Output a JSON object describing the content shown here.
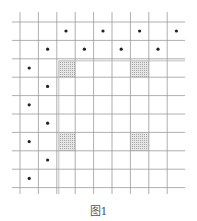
{
  "figure": {
    "caption": "图1",
    "grid": {
      "columns": 9,
      "rows": 9,
      "x_lines": [
        20,
        38.4,
        56.8,
        75.2,
        93.6,
        112,
        130.4,
        148.8,
        167.2
      ],
      "y_lines": [
        22,
        40.4,
        58.8,
        77.2,
        95.6,
        114,
        132.4,
        150.8,
        169.2,
        187.6
      ],
      "h_line_extent": [
        12,
        185
      ],
      "v_line_extent": [
        12,
        194
      ],
      "line_color": "#9a9a9a"
    },
    "inner_frame": {
      "x_line": 58.8,
      "y_line": 60.8,
      "color": "#b0b0b0"
    },
    "shaded_cells": [
      {
        "x": 58.8,
        "y": 60.8,
        "w": 16.4,
        "h": 16.4
      },
      {
        "x": 130.4,
        "y": 60.8,
        "w": 18.4,
        "h": 16.4
      },
      {
        "x": 58.8,
        "y": 132.4,
        "w": 16.4,
        "h": 18.4
      },
      {
        "x": 130.4,
        "y": 132.4,
        "w": 18.4,
        "h": 18.4
      }
    ],
    "dots": [
      {
        "x": 66,
        "y": 31
      },
      {
        "x": 103,
        "y": 31
      },
      {
        "x": 139.6,
        "y": 31
      },
      {
        "x": 176.4,
        "y": 31
      },
      {
        "x": 47.6,
        "y": 49.2
      },
      {
        "x": 84.4,
        "y": 49.2
      },
      {
        "x": 121.2,
        "y": 49.2
      },
      {
        "x": 158,
        "y": 49.2
      },
      {
        "x": 29.2,
        "y": 68
      },
      {
        "x": 47.6,
        "y": 86.4
      },
      {
        "x": 29.2,
        "y": 104.8
      },
      {
        "x": 47.6,
        "y": 123.2
      },
      {
        "x": 29.2,
        "y": 141.6
      },
      {
        "x": 47.6,
        "y": 160
      },
      {
        "x": 29.2,
        "y": 178.4
      }
    ],
    "dot_color": "#222222",
    "shade_color": "#cfcfcf"
  }
}
